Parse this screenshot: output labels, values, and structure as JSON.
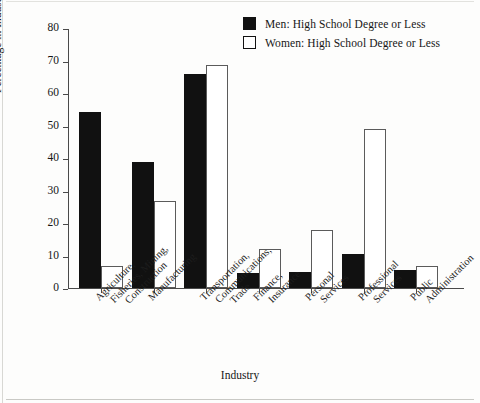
{
  "chart_data": {
    "type": "bar",
    "title": "",
    "xlabel": "Industry",
    "ylabel": "Percentage in Industry",
    "ylim": [
      0,
      80
    ],
    "yticks": [
      0,
      10,
      20,
      30,
      40,
      50,
      60,
      70,
      80
    ],
    "grid": false,
    "legend_position": "top-right",
    "categories": [
      "Agriculture, Fisheries, Mining, Construction",
      "Manufacturing",
      "Transportation, Communications, Trade",
      "Finance, Insurance",
      "Personal Services",
      "Professional Services",
      "Public Administration"
    ],
    "category_lines": [
      [
        "Agriculture,",
        "Fisheries, Mining,",
        "Construction"
      ],
      [
        "Manufacturing"
      ],
      [
        "Transportation,",
        "Communications,",
        "Trade"
      ],
      [
        "Finance,",
        "Insurance"
      ],
      [
        "Personal",
        "Services"
      ],
      [
        "Professional",
        "Services"
      ],
      [
        "Public",
        "Administration"
      ]
    ],
    "series": [
      {
        "name": "Men: High School Degree or Less",
        "color": "#111111",
        "style": "filled",
        "values": [
          54.1,
          38.7,
          65.8,
          4.6,
          5.0,
          10.4,
          5.6
        ]
      },
      {
        "name": "Women: High School Degree or Less",
        "color": "#ffffff",
        "style": "hollow",
        "values": [
          6.9,
          26.7,
          68.6,
          12.1,
          18.0,
          49.0,
          6.7
        ]
      }
    ]
  },
  "legend": {
    "items": [
      {
        "label": "Men: High School Degree or Less",
        "swatch": "filled"
      },
      {
        "label": "Women: High School Degree or Less",
        "swatch": "hollow"
      }
    ]
  }
}
